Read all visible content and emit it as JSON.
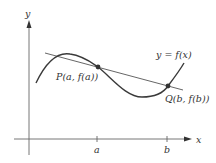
{
  "diagram": {
    "axis_labels": {
      "x": "x",
      "y": "y"
    },
    "ticks": {
      "a": "a",
      "b": "b"
    },
    "curve_label": "y = f(x)",
    "point_p_label": "P(a, f(a))",
    "point_q_label": "Q(b, f(b))",
    "colors": {
      "curve": "#3a3a3a",
      "line": "#555555",
      "axis": "#555555",
      "point": "#333333"
    }
  }
}
